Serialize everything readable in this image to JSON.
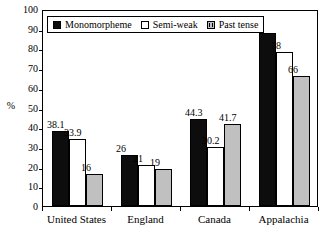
{
  "chart_data": {
    "type": "bar",
    "title": "",
    "xlabel": "",
    "ylabel": "%",
    "ylim": [
      0,
      100
    ],
    "ytick_step": 10,
    "yticks": [
      100,
      90,
      80,
      70,
      60,
      50,
      40,
      30,
      20,
      10,
      0
    ],
    "grid": false,
    "legend_position": "top-left-inside",
    "categories": [
      "United States",
      "England",
      "Canada",
      "Appalachia"
    ],
    "series": [
      {
        "name": "Monomorpheme",
        "color": "#0d0d0d",
        "values": [
          38.1,
          26,
          44.3,
          88
        ],
        "labels": [
          "38.1",
          "26",
          "44.3",
          "88"
        ]
      },
      {
        "name": "Semi-weak",
        "color": "#ffffff",
        "values": [
          33.9,
          21,
          30.2,
          78
        ],
        "labels": [
          "33.9",
          "21",
          "30.2",
          "78"
        ]
      },
      {
        "name": "Past tense",
        "color": "#c0c0c0",
        "values": [
          16,
          19,
          41.7,
          66
        ],
        "labels": [
          "16",
          "19",
          "41.7",
          "66"
        ]
      }
    ]
  },
  "axis": {
    "unit_label": "%",
    "tick_labels": [
      "100",
      "90",
      "80",
      "70",
      "60",
      "50",
      "40",
      "30",
      "20",
      "10",
      "0"
    ]
  },
  "legend": {
    "items": [
      {
        "label": "Monomorpheme",
        "swatch": "black-square-icon"
      },
      {
        "label": "Semi-weak",
        "swatch": "white-square-icon"
      },
      {
        "label": "Past tense",
        "swatch": "gray-square-icon"
      }
    ]
  }
}
